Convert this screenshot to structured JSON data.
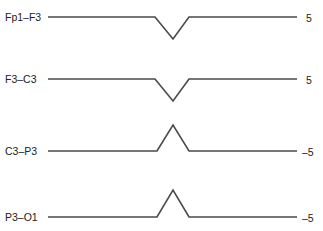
{
  "diagram": {
    "type": "eeg-bipolar-montage-phase-reversal",
    "channels": [
      {
        "label": "Fp1–F3",
        "value": "5",
        "deflection": "down",
        "baseline_y": 17,
        "apex_y": 39,
        "label_y": 11,
        "value_y": 12
      },
      {
        "label": "F3–C3",
        "value": "5",
        "deflection": "down",
        "baseline_y": 79,
        "apex_y": 101,
        "label_y": 73,
        "value_y": 74
      },
      {
        "label": "C3–P3",
        "value": "–5",
        "deflection": "up",
        "baseline_y": 151,
        "apex_y": 125,
        "label_y": 145,
        "value_y": 146
      },
      {
        "label": "P3–O1",
        "value": "–5",
        "deflection": "up",
        "baseline_y": 217,
        "apex_y": 190,
        "label_y": 211,
        "value_y": 212
      }
    ],
    "trace_color": "#4a4a4a"
  }
}
